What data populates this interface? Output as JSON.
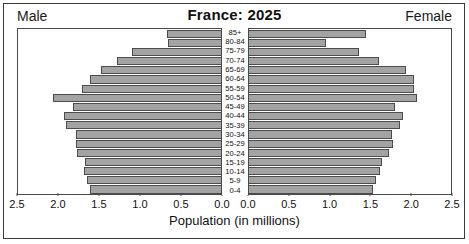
{
  "chart_data": {
    "type": "bar",
    "subtype": "population-pyramid",
    "title": "France: 2025",
    "xlabel": "Population (in millions)",
    "ylabel": "",
    "xlim": [
      0,
      2.5
    ],
    "xticks": [
      "2.5",
      "2.0",
      "1.5",
      "1.0",
      "0.5",
      "0.0"
    ],
    "xticks_right": [
      "0.0",
      "0.5",
      "1.0",
      "1.5",
      "2.0",
      "2.5"
    ],
    "xtick_values": [
      2.5,
      2.0,
      1.5,
      1.0,
      0.5,
      0.0
    ],
    "grid": false,
    "legend_position": "corners",
    "categories": [
      "85+",
      "80-84",
      "75-79",
      "70-74",
      "65-69",
      "60-64",
      "55-59",
      "50-54",
      "45-49",
      "40-44",
      "35-39",
      "30-34",
      "25-29",
      "20-24",
      "15-19",
      "10-14",
      "5-9",
      "0-4"
    ],
    "series": [
      {
        "name": "Male",
        "side": "left",
        "values": [
          0.68,
          0.67,
          1.11,
          1.29,
          1.49,
          1.62,
          1.73,
          2.08,
          1.83,
          1.95,
          1.92,
          1.8,
          1.8,
          1.78,
          1.69,
          1.7,
          1.66,
          1.63
        ]
      },
      {
        "name": "Female",
        "side": "right",
        "values": [
          1.46,
          0.96,
          1.37,
          1.62,
          1.95,
          2.06,
          2.06,
          2.09,
          1.82,
          1.92,
          1.88,
          1.78,
          1.8,
          1.74,
          1.66,
          1.63,
          1.58,
          1.55
        ]
      }
    ],
    "colors": {
      "bar_fill": "#a3a3a3",
      "bar_border": "#4c4c4c",
      "frame": "#3a3a3a",
      "text": "#111111",
      "background": "#ffffff"
    }
  },
  "labels": {
    "male": "Male",
    "female": "Female"
  }
}
